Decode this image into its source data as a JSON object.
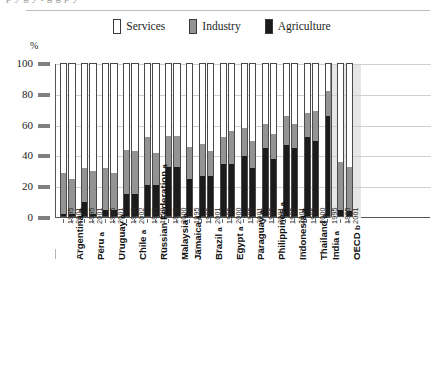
{
  "top_cut_text": "p  y      g            y                    t    g  g          p  y",
  "axis_unit": "%",
  "legend": {
    "position": "top-center",
    "entries": [
      {
        "label": "Services",
        "color": "#ffffff",
        "name": "services"
      },
      {
        "label": "Industry",
        "color": "#939393",
        "name": "industry"
      },
      {
        "label": "Agriculture",
        "color": "#1b1b1b",
        "name": "agriculture"
      }
    ]
  },
  "colors": {
    "services": "#ffffff",
    "industry": "#939393",
    "agriculture": "#1b1b1b",
    "axis": "#555555",
    "gridline": "#cfcfcf",
    "oecd_panel": "#e6e6e6"
  },
  "chart_data": {
    "type": "bar",
    "title": "",
    "subtitle": "",
    "xlabel": "",
    "ylabel": "%",
    "ylim": [
      0,
      100
    ],
    "yticks": [
      0,
      20,
      40,
      60,
      80,
      100
    ],
    "grid": true,
    "stacked": true,
    "stack_order_bottom_to_top": [
      "Agriculture",
      "Industry",
      "Services"
    ],
    "series": [
      {
        "name": "Agriculture",
        "color": "#1b1b1b"
      },
      {
        "name": "Industry",
        "color": "#939393"
      },
      {
        "name": "Services",
        "color": "#ffffff"
      }
    ],
    "note": "Each bar is a 100% stacked column; Services is the remainder to 100.",
    "groups": [
      {
        "country": "Argentina",
        "marker": "a",
        "bars": [
          {
            "year": "1995",
            "agriculture": 1,
            "industry": 27,
            "services": 72
          },
          {
            "year": "2001",
            "agriculture": 1,
            "industry": 23,
            "services": 76
          }
        ]
      },
      {
        "country": "Peru",
        "marker": "a",
        "bars": [
          {
            "year": "1995",
            "agriculture": 9,
            "industry": 22,
            "services": 69
          },
          {
            "year": "2001",
            "agriculture": 1,
            "industry": 28,
            "services": 71
          }
        ]
      },
      {
        "country": "Uruguay",
        "marker": "a",
        "bars": [
          {
            "year": "1995",
            "agriculture": 4,
            "industry": 27,
            "services": 69
          },
          {
            "year": "2001",
            "agriculture": 4,
            "industry": 24,
            "services": 72
          }
        ]
      },
      {
        "country": "Chile",
        "marker": "a",
        "bars": [
          {
            "year": "1995",
            "agriculture": 14,
            "industry": 29,
            "services": 57
          },
          {
            "year": "2002",
            "agriculture": 14,
            "industry": 28,
            "services": 58
          }
        ]
      },
      {
        "country": "Russian Federation",
        "marker": "a",
        "bars": [
          {
            "year": "1995",
            "agriculture": 20,
            "industry": 31,
            "services": 49
          },
          {
            "year": "1999",
            "agriculture": 20,
            "industry": 21,
            "services": 59
          }
        ]
      },
      {
        "country": "Malaysia",
        "marker": "a",
        "bars": [
          {
            "year": "1995",
            "agriculture": 32,
            "industry": 20,
            "services": 48
          },
          {
            "year": "2000",
            "agriculture": 32,
            "industry": 20,
            "services": 48
          }
        ]
      },
      {
        "country": "Jamaica",
        "marker": "a",
        "bars": [
          {
            "year": "1995",
            "agriculture": 24,
            "industry": 21,
            "services": 55
          }
        ]
      },
      {
        "country": "Brazil",
        "marker": "a",
        "bars": [
          {
            "year": "1995",
            "agriculture": 26,
            "industry": 21,
            "services": 53
          },
          {
            "year": "2001",
            "agriculture": 26,
            "industry": 16,
            "services": 58
          }
        ]
      },
      {
        "country": "Egypt",
        "marker": "a",
        "bars": [
          {
            "year": "1995",
            "agriculture": 34,
            "industry": 17,
            "services": 49
          },
          {
            "year": "2000",
            "agriculture": 34,
            "industry": 21,
            "services": 45
          }
        ]
      },
      {
        "country": "Paraguay",
        "marker": "a",
        "bars": [
          {
            "year": "1995",
            "agriculture": 39,
            "industry": 18,
            "services": 43
          },
          {
            "year": "2001",
            "agriculture": 31,
            "industry": 18,
            "services": 51
          }
        ]
      },
      {
        "country": "Philippines",
        "marker": "a",
        "bars": [
          {
            "year": "1995",
            "agriculture": 44,
            "industry": 16,
            "services": 40
          },
          {
            "year": "2001",
            "agriculture": 37,
            "industry": 16,
            "services": 47
          }
        ]
      },
      {
        "country": "Indonesia",
        "marker": "a",
        "bars": [
          {
            "year": "1995",
            "agriculture": 46,
            "industry": 19,
            "services": 35
          },
          {
            "year": "2001",
            "agriculture": 44,
            "industry": 16,
            "services": 40
          }
        ]
      },
      {
        "country": "Thailand",
        "marker": "a",
        "bars": [
          {
            "year": "1995",
            "agriculture": 51,
            "industry": 16,
            "services": 33
          },
          {
            "year": "2000",
            "agriculture": 49,
            "industry": 19,
            "services": 32
          }
        ]
      },
      {
        "country": "India",
        "marker": "a",
        "bars": [
          {
            "year": "1995",
            "agriculture": 65,
            "industry": 16,
            "services": 19
          }
        ]
      },
      {
        "country": "OECD",
        "marker": "b",
        "panel": true,
        "bars": [
          {
            "year": "1995",
            "agriculture": 4,
            "industry": 31,
            "services": 65
          },
          {
            "year": "2001",
            "agriculture": 3,
            "industry": 29,
            "services": 68
          }
        ]
      }
    ]
  }
}
